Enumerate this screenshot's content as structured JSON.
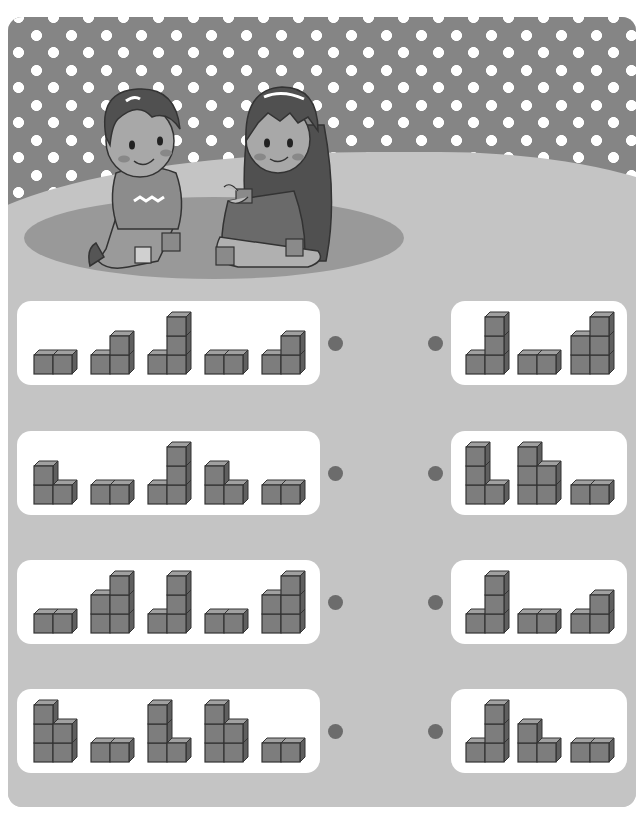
{
  "worksheet": {
    "header_text": "",
    "illustration": {
      "description": "boy and girl playing with cube blocks on a rug",
      "loose_blocks": 4
    },
    "colors": {
      "wall": "#858585",
      "floor": "#c4c4c4",
      "rug": "#999999",
      "card": "#ffffff",
      "cube_front": "#7d7d7d",
      "cube_top": "#a0a0a0",
      "cube_side": "#5f5f5f",
      "cube_outline": "#333333",
      "match_dot": "#6c6c6c"
    },
    "rows": [
      {
        "left": [
          {
            "cols": [
              1,
              1
            ]
          },
          {
            "cols": [
              1,
              2
            ]
          },
          {
            "cols": [
              1,
              3
            ]
          },
          {
            "cols": [
              1,
              1
            ]
          },
          {
            "cols": [
              1,
              2
            ]
          }
        ],
        "right": [
          {
            "cols": [
              1,
              3
            ]
          },
          {
            "cols": [
              1,
              1
            ]
          },
          {
            "cols": [
              2,
              3
            ]
          }
        ]
      },
      {
        "left": [
          {
            "cols": [
              2,
              1
            ]
          },
          {
            "cols": [
              1,
              1
            ]
          },
          {
            "cols": [
              1,
              3
            ]
          },
          {
            "cols": [
              2,
              1
            ]
          },
          {
            "cols": [
              1,
              1
            ]
          }
        ],
        "right": [
          {
            "cols": [
              3,
              1
            ]
          },
          {
            "cols": [
              3,
              2
            ]
          },
          {
            "cols": [
              1,
              1
            ]
          }
        ]
      },
      {
        "left": [
          {
            "cols": [
              1,
              1
            ]
          },
          {
            "cols": [
              2,
              3
            ]
          },
          {
            "cols": [
              1,
              3
            ]
          },
          {
            "cols": [
              1,
              1
            ]
          },
          {
            "cols": [
              2,
              3
            ]
          }
        ],
        "right": [
          {
            "cols": [
              1,
              3
            ]
          },
          {
            "cols": [
              1,
              1
            ]
          },
          {
            "cols": [
              1,
              2
            ]
          }
        ]
      },
      {
        "left": [
          {
            "cols": [
              3,
              2
            ]
          },
          {
            "cols": [
              1,
              1
            ]
          },
          {
            "cols": [
              3,
              1
            ]
          },
          {
            "cols": [
              3,
              2
            ]
          },
          {
            "cols": [
              1,
              1
            ]
          }
        ],
        "right": [
          {
            "cols": [
              1,
              3
            ]
          },
          {
            "cols": [
              2,
              1
            ]
          },
          {
            "cols": [
              1,
              1
            ]
          }
        ]
      }
    ]
  }
}
